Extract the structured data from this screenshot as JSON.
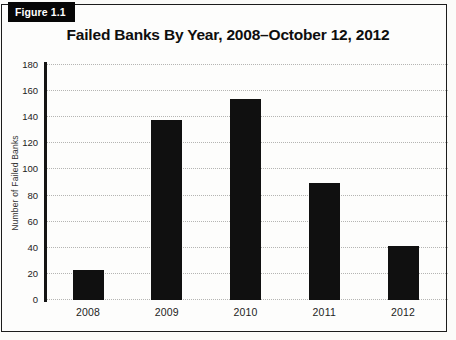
{
  "figure_label": "Figure 1.1",
  "chart_data": {
    "type": "bar",
    "title": "Failed Banks By Year, 2008–October 12, 2012",
    "categories": [
      "2008",
      "2009",
      "2010",
      "2011",
      "2012"
    ],
    "values": [
      23,
      138,
      154,
      90,
      41
    ],
    "xlabel": "",
    "ylabel": "Number of Failed Banks",
    "ylim": [
      0,
      180
    ],
    "yticks": [
      0,
      20,
      40,
      60,
      80,
      100,
      120,
      140,
      160,
      180
    ],
    "grid": "horizontal dotted lines, including baseline",
    "legend_position": "none",
    "bar_color": "#101010",
    "gridline_color": "#b5b5b3",
    "border_color": "#1c1c1c",
    "tab_background": "#060606",
    "tab_text_color": "#ffffff"
  }
}
